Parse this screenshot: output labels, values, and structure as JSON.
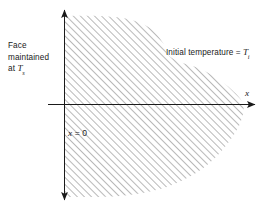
{
  "figure": {
    "background_color": "#ffffff",
    "ink_color": "#1a1a1a",
    "hatch_color": "#555555"
  },
  "labels": {
    "face_line1": "Face",
    "face_line2": "maintained",
    "face_line3_prefix": "at ",
    "face_line3_symbol": "T",
    "face_line3_subscript": "s",
    "initial_prefix": "Initial temperature = ",
    "initial_symbol": "T",
    "initial_subscript": "i",
    "origin_label_symbol": "x",
    "origin_label_rest": " = 0",
    "axis_x_label": "x"
  },
  "axes": {
    "vertical_axis_x_px": 64,
    "horizontal_axis_y_px": 105,
    "vertical_axis_top_px": 10,
    "vertical_axis_bottom_px": 200,
    "horizontal_axis_left_px": 48,
    "horizontal_axis_right_px": 262,
    "arrow_up": "arrow-up",
    "arrow_down": "arrow-down",
    "arrow_right": "arrow-right"
  },
  "chart_data": {
    "type": "area",
    "xlabel": "x",
    "ylabel": "",
    "annotations": [
      "Face maintained at Ts",
      "Initial temperature = Ti",
      "x = 0"
    ],
    "region": {
      "name": "hatched-solid-region",
      "description": "Semi-infinite solid hatched with 45 degree lines, bounded on the left by the plane x = 0 and on the right by an irregular free boundary.",
      "hatch_angle_deg": 45,
      "hatch_spacing_px": 5,
      "left_boundary_x_px": 64,
      "boundary_points_px": [
        [
          64,
          16
        ],
        [
          100,
          16
        ],
        [
          128,
          19
        ],
        [
          150,
          28
        ],
        [
          163,
          43
        ],
        [
          168,
          55
        ],
        [
          180,
          62
        ],
        [
          198,
          68
        ],
        [
          215,
          77
        ],
        [
          232,
          90
        ],
        [
          243,
          104
        ],
        [
          241,
          121
        ],
        [
          231,
          139
        ],
        [
          215,
          158
        ],
        [
          196,
          173
        ],
        [
          172,
          185
        ],
        [
          148,
          192
        ],
        [
          120,
          196
        ],
        [
          92,
          197
        ],
        [
          64,
          197
        ]
      ]
    }
  }
}
